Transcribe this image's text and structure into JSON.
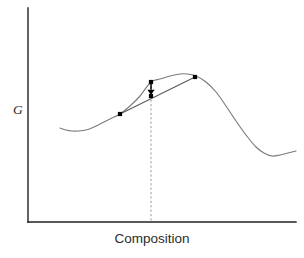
{
  "figure": {
    "kind": "free-energy-composition-diagram",
    "background_color": "#ffffff"
  },
  "axes": {
    "y_label": "G",
    "x_label": "Composition",
    "axis_color": "#231f20",
    "y_axis": {
      "x": 28,
      "y_top": 8,
      "y_bottom": 222
    },
    "x_axis": {
      "y": 222,
      "x_left": 28,
      "x_right": 296
    }
  },
  "chart_data": {
    "type": "line",
    "title": "",
    "xlabel": "Composition",
    "ylabel": "G",
    "grid": false,
    "legend": null,
    "axis_ticks": {
      "x": [],
      "y": []
    },
    "xlim": [
      28,
      296
    ],
    "ylim": [
      222,
      8
    ],
    "series": [
      {
        "name": "Gibbs free energy curve",
        "role": "free-energy-curve",
        "color": "#7b7b80",
        "style": "solid",
        "points": [
          [
            60,
            128
          ],
          [
            66,
            130
          ],
          [
            72,
            131
          ],
          [
            78,
            131
          ],
          [
            86,
            130
          ],
          [
            94,
            127
          ],
          [
            102,
            123
          ],
          [
            110,
            119
          ],
          [
            120,
            114
          ],
          [
            130,
            106
          ],
          [
            140,
            96
          ],
          [
            151,
            82
          ],
          [
            160,
            79
          ],
          [
            170,
            76
          ],
          [
            180,
            74
          ],
          [
            187,
            74
          ],
          [
            196,
            76
          ],
          [
            206,
            82
          ],
          [
            216,
            92
          ],
          [
            226,
            106
          ],
          [
            236,
            121
          ],
          [
            246,
            135
          ],
          [
            256,
            147
          ],
          [
            264,
            153
          ],
          [
            272,
            156
          ],
          [
            280,
            155
          ],
          [
            288,
            153
          ],
          [
            296,
            151
          ]
        ]
      },
      {
        "name": "Common tangent chord",
        "role": "chord",
        "color": "#58585c",
        "style": "solid",
        "points": [
          [
            120,
            114
          ],
          [
            195,
            77
          ]
        ]
      },
      {
        "name": "Composition tie line",
        "role": "tie-line",
        "color": "#9a9a9e",
        "style": "dashed",
        "points": [
          [
            151,
            82
          ],
          [
            151,
            222
          ]
        ]
      }
    ],
    "markers": [
      {
        "name": "left-tangent-point",
        "x": 120,
        "y": 114,
        "size": 4.2
      },
      {
        "name": "curve-point-at-composition",
        "x": 151,
        "y": 82,
        "size": 4.2
      },
      {
        "name": "chord-point-at-composition",
        "x": 151,
        "y": 96,
        "size": 4.2
      },
      {
        "name": "right-tangent-point",
        "x": 195,
        "y": 77,
        "size": 4.2
      }
    ],
    "annotations": [
      {
        "name": "driving-force-arrow",
        "type": "arrow",
        "direction": "down",
        "from": [
          151,
          84
        ],
        "to": [
          151,
          95
        ],
        "color": "#000000"
      }
    ]
  }
}
